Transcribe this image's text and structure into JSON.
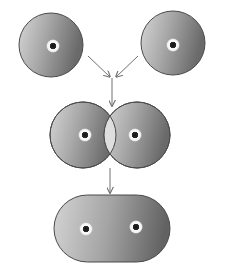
{
  "diagram": {
    "title": "",
    "colors": {
      "background": "#ffffff",
      "cell_light": "#d8d8d8",
      "cell_mid": "#a8a8a8",
      "cell_dark": "#6e6e6e",
      "outline": "#4a4a4a",
      "overlap": "#dcdcdc",
      "nucleus_ring": "#ffffff",
      "nucleus_core": "#1a1a1a",
      "arrow": "#707070"
    },
    "stages": [
      {
        "id": "separate-cells",
        "label": "",
        "cells": 2,
        "nuclei": 2
      },
      {
        "id": "overlapping-cells",
        "label": "",
        "cells": 2,
        "nuclei": 2
      },
      {
        "id": "fused-cell",
        "label": "",
        "cells": 1,
        "nuclei": 2
      }
    ],
    "arrows": [
      {
        "from": "top-left-cell",
        "to": "merge-point"
      },
      {
        "from": "top-right-cell",
        "to": "merge-point"
      },
      {
        "from": "merge-point",
        "to": "overlapping-cells"
      },
      {
        "from": "overlapping-cells",
        "to": "fused-cell"
      }
    ]
  }
}
